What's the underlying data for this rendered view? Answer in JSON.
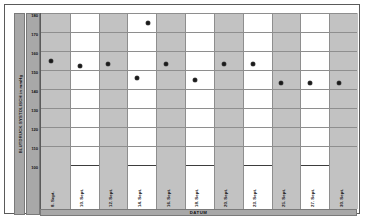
{
  "chart_data": {
    "type": "scatter",
    "title": "",
    "xlabel": "DATUM",
    "ylabel": "BLUTDRUCK SYSTOLISCH in mmHg",
    "ylim": [
      100,
      180
    ],
    "yticks": [
      180,
      170,
      160,
      150,
      140,
      130,
      120,
      110,
      100
    ],
    "grid": true,
    "legend": "none",
    "categories": [
      "8. Sept.",
      "10. Sept.",
      "12. Sept.",
      "14. Sept.",
      "16. Sept.",
      "18. Sept.",
      "20. Sept.",
      "23. Sept.",
      "25. Sept.",
      "27. Sept.",
      "30. Sept."
    ],
    "series": [
      {
        "name": "Blutdruck systolisch",
        "values": [
          155,
          152,
          153,
          146,
          175,
          153,
          145,
          153,
          153,
          143,
          143
        ]
      }
    ],
    "points": [
      {
        "category": "8. Sept.",
        "value": 155
      },
      {
        "category": "10. Sept.",
        "value": 152
      },
      {
        "category": "12. Sept.",
        "value": 153
      },
      {
        "category": "14. Sept.",
        "value": 146
      },
      {
        "category": "14. Sept.",
        "value": 175
      },
      {
        "category": "16. Sept.",
        "value": 153
      },
      {
        "category": "18. Sept.",
        "value": 145
      },
      {
        "category": "20. Sept.",
        "value": 153
      },
      {
        "category": "23. Sept.",
        "value": 153
      },
      {
        "category": "25. Sept.",
        "value": 143
      },
      {
        "category": "27. Sept.",
        "value": 143
      },
      {
        "category": "30. Sept.",
        "value": 143
      }
    ],
    "colors": {
      "marker": "#1a1a1a",
      "band": "#c2c2c2",
      "grid": "#8e8e8e",
      "axis": "#5a5a5a",
      "label_strip": "#a8a8a8"
    }
  }
}
